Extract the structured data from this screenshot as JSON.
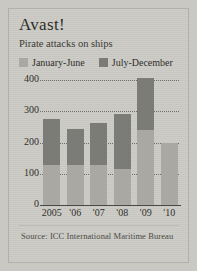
{
  "figure": {
    "title": "Avast!",
    "subtitle": "Pirate attacks on ships",
    "source": "Source: ICC International Maritime Bureau",
    "background_color": "#cbcac4",
    "legend": [
      {
        "label": "January-June",
        "color": "#a9a8a2",
        "swatch": "light"
      },
      {
        "label": "July-December",
        "color": "#7b7b77",
        "swatch": "dark"
      }
    ]
  },
  "chart_data": {
    "type": "bar",
    "stacked": true,
    "title": "Avast!",
    "subtitle": "Pirate attacks on ships",
    "xlabel": "",
    "ylabel": "",
    "ylim": [
      0,
      420
    ],
    "yticks": [
      0,
      100,
      200,
      300,
      400
    ],
    "ytick_labels": [
      "0",
      "100",
      "200",
      "300",
      "400"
    ],
    "grid": "horizontal-dotted",
    "legend_position": "top-left",
    "categories": [
      "2005",
      "'06",
      "'07",
      "'08",
      "'09",
      "'10"
    ],
    "series": [
      {
        "name": "January-June",
        "color": "#a9a8a2",
        "values": [
          127,
          127,
          127,
          114,
          240,
          200
        ]
      },
      {
        "name": "July-December",
        "color": "#7b7b77",
        "values": [
          149,
          117,
          136,
          179,
          166,
          0
        ]
      }
    ],
    "totals": [
      276,
      244,
      263,
      293,
      406,
      200
    ],
    "annotations": [
      "Source: ICC International Maritime Bureau"
    ]
  }
}
